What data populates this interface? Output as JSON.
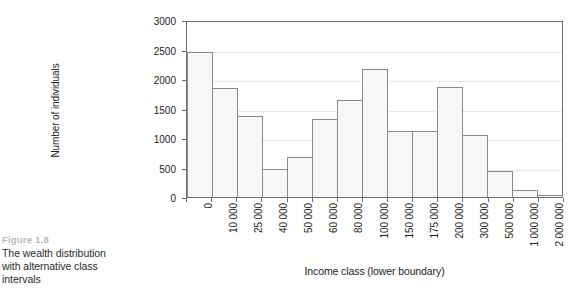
{
  "caption": {
    "figure_number": "Figure 1.8",
    "lines": [
      "The wealth distribution",
      "with alternative class",
      "intervals"
    ],
    "figure_number_color": "#b9b9b9"
  },
  "chart_data": {
    "type": "bar",
    "title": "",
    "xlabel": "Income class (lower boundary)",
    "ylabel": "Number of individuals",
    "categories": [
      "0",
      "10 000",
      "25 000",
      "40 000",
      "50 000",
      "60 000",
      "80 000",
      "100 000",
      "150 000",
      "175 000",
      "200 000",
      "300 000",
      "500 000",
      "1 000 000",
      "2 000 000"
    ],
    "values": [
      2460,
      1840,
      1380,
      480,
      670,
      1320,
      1650,
      2170,
      1120,
      1120,
      1870,
      1050,
      440,
      120,
      40
    ],
    "ylim": [
      0,
      3000
    ],
    "yticks": [
      0,
      500,
      1000,
      1500,
      2000,
      2500,
      3000
    ],
    "ytick_labels": [
      "0",
      "500",
      "1000",
      "1500",
      "2000",
      "2500",
      "3000"
    ],
    "grid": "horizontal-dotted",
    "legend": "none",
    "bar_fill": "#f7f7f7",
    "bar_edge": "#8a8a8a",
    "axis_color": "#6e6e6e"
  }
}
